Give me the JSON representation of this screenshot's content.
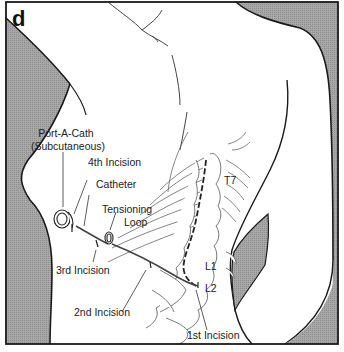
{
  "figure": {
    "panel_letter": "d",
    "colors": {
      "background": "#ffffff",
      "shading": "#9a9a9a",
      "outline": "#1a1a1a",
      "catheter": "#444444",
      "bone_lines": "#555555"
    }
  },
  "labels": {
    "port_a_cath_line1": "Port-A-Cath",
    "port_a_cath_line2": "(Subcutaneous)",
    "fourth_incision": "4th Incision",
    "catheter": "Catheter",
    "tensioning_loop_line1": "Tensioning",
    "tensioning_loop_line2": "Loop",
    "third_incision": "3rd Incision",
    "second_incision": "2nd Incision",
    "first_incision": "1st Incision",
    "t7": "T7",
    "l1": "L1",
    "l2": "L2"
  }
}
